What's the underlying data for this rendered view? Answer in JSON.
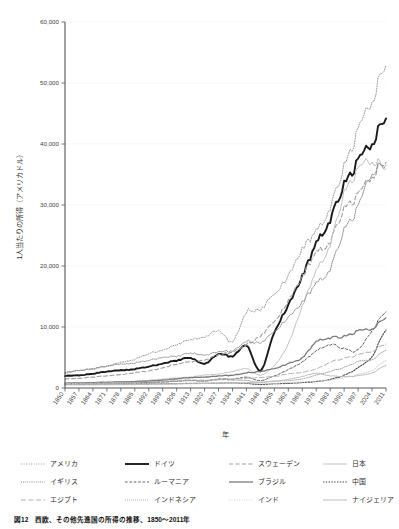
{
  "figure": {
    "caption": "図12　西欧、その他先進国の所得の推移、1850～2011年"
  },
  "chart_data": {
    "type": "line",
    "title": "",
    "xlabel": "年",
    "ylabel": "1人当たりの所得（アメリカドル）",
    "xlim": [
      1850,
      2011
    ],
    "ylim": [
      0,
      60000
    ],
    "ytick_labels": [
      "0",
      "10,000",
      "20,000",
      "30,000",
      "40,000",
      "50,000",
      "60,000"
    ],
    "ytick_values": [
      0,
      10000,
      20000,
      30000,
      40000,
      50000,
      60000
    ],
    "xtick_labels": [
      "1850",
      "1857",
      "1864",
      "1871",
      "1878",
      "1885",
      "1892",
      "1899",
      "1906",
      "1913",
      "1920",
      "1927",
      "1934",
      "1941",
      "1948",
      "1955",
      "1962",
      "1969",
      "1976",
      "1983",
      "1990",
      "1997",
      "2004",
      "2011"
    ],
    "xtick_values": [
      1850,
      1857,
      1864,
      1871,
      1878,
      1885,
      1892,
      1899,
      1906,
      1913,
      1920,
      1927,
      1934,
      1941,
      1948,
      1955,
      1962,
      1969,
      1976,
      1983,
      1990,
      1997,
      2004,
      2011
    ],
    "grid": true,
    "grid_axis": "y",
    "legend_position": "below",
    "legend_columns": 4,
    "x": [
      1850,
      1857,
      1864,
      1871,
      1878,
      1885,
      1892,
      1899,
      1906,
      1913,
      1920,
      1927,
      1934,
      1941,
      1948,
      1955,
      1962,
      1969,
      1976,
      1983,
      1990,
      1997,
      2004,
      2011
    ],
    "series": [
      {
        "name": "アメリカ",
        "style": "dotted",
        "color": "#9a9a9a",
        "width": 1.0,
        "values": [
          2400,
          2900,
          3100,
          3600,
          4200,
          4700,
          5600,
          6200,
          7100,
          7900,
          8200,
          9500,
          7600,
          12500,
          12800,
          15500,
          18300,
          23000,
          25500,
          29500,
          36500,
          42000,
          47500,
          52900
        ]
      },
      {
        "name": "ドイツ",
        "style": "solid",
        "color": "#1a1a1a",
        "width": 1.9,
        "values": [
          2000,
          2100,
          2350,
          2700,
          2900,
          3100,
          3500,
          4000,
          4500,
          4900,
          3900,
          5600,
          5200,
          7000,
          2800,
          9200,
          13500,
          18500,
          23500,
          27500,
          33500,
          37000,
          40500,
          44200
        ]
      },
      {
        "name": "スウェーデン",
        "style": "dashed",
        "color": "#a0a0a0",
        "width": 1.1,
        "values": [
          1500,
          1600,
          1800,
          2000,
          2200,
          2500,
          2800,
          3300,
          3900,
          4300,
          4500,
          5500,
          5900,
          7200,
          8500,
          11000,
          14200,
          18500,
          22000,
          24000,
          29500,
          31500,
          35000,
          37000
        ]
      },
      {
        "name": "日本",
        "style": "solid-light",
        "color": "#c2c2c2",
        "width": 1.0,
        "values": [
          800,
          820,
          860,
          900,
          1000,
          1100,
          1250,
          1450,
          1650,
          1800,
          2100,
          2300,
          2700,
          3200,
          2100,
          3700,
          7200,
          13500,
          19000,
          23500,
          32000,
          35500,
          37500,
          36000
        ]
      },
      {
        "name": "イギリス",
        "style": "dotted-dense",
        "color": "#8f8f8f",
        "width": 1.0,
        "values": [
          2600,
          2900,
          3200,
          3600,
          3900,
          4100,
          4500,
          5000,
          5200,
          5700,
          5300,
          6000,
          6100,
          7700,
          7400,
          9300,
          11500,
          14200,
          17000,
          19500,
          26000,
          29500,
          35500,
          36500
        ]
      },
      {
        "name": "ルーマニア",
        "style": "dash-short",
        "color": "#606060",
        "width": 1.0,
        "values": [
          600,
          620,
          660,
          700,
          760,
          820,
          900,
          980,
          1100,
          1250,
          1100,
          1500,
          1450,
          1800,
          1200,
          2000,
          3000,
          4300,
          6000,
          7100,
          6500,
          6200,
          9500,
          12500
        ]
      },
      {
        "name": "ブラジル",
        "style": "solid-mid",
        "color": "#7a7a7a",
        "width": 1.3,
        "values": [
          800,
          850,
          900,
          950,
          1000,
          1050,
          1150,
          1300,
          1500,
          1700,
          1750,
          2000,
          2100,
          2500,
          2700,
          3200,
          4000,
          5000,
          7500,
          8200,
          8500,
          9300,
          9800,
          11500
        ]
      },
      {
        "name": "中国",
        "style": "dotted-bold",
        "color": "#444444",
        "width": 1.1,
        "values": [
          700,
          690,
          670,
          660,
          650,
          660,
          680,
          700,
          720,
          750,
          760,
          800,
          820,
          760,
          560,
          700,
          750,
          900,
          1050,
          1400,
          2100,
          3300,
          5200,
          9500
        ]
      },
      {
        "name": "エジプト",
        "style": "dash-long",
        "color": "#b0b0b0",
        "width": 1.0,
        "values": [
          750,
          760,
          800,
          850,
          900,
          950,
          1000,
          1100,
          1200,
          1300,
          1250,
          1400,
          1450,
          1600,
          1700,
          1900,
          2300,
          2600,
          3100,
          4200,
          4900,
          5400,
          6100,
          7200
        ]
      },
      {
        "name": "インドネシア",
        "style": "dotted-fine",
        "color": "#9c9c9c",
        "width": 0.9,
        "values": [
          650,
          670,
          700,
          730,
          780,
          830,
          900,
          980,
          1100,
          1200,
          1150,
          1350,
          1300,
          1250,
          900,
          1150,
          1200,
          1500,
          2100,
          2700,
          3400,
          4300,
          4700,
          6200
        ]
      },
      {
        "name": "インド",
        "style": "dotted-pale",
        "color": "#c8c8c8",
        "width": 0.9,
        "values": [
          700,
          690,
          700,
          690,
          700,
          710,
          720,
          730,
          740,
          760,
          730,
          780,
          790,
          800,
          700,
          780,
          900,
          980,
          1100,
          1300,
          1700,
          2200,
          2900,
          4500
        ]
      },
      {
        "name": "ナイジェリア",
        "style": "solid-pale",
        "color": "#bdbdbd",
        "width": 1.0,
        "values": [
          500,
          510,
          520,
          530,
          550,
          570,
          600,
          630,
          660,
          700,
          720,
          800,
          850,
          900,
          950,
          1100,
          1400,
          1900,
          2400,
          2000,
          1900,
          2000,
          2500,
          3700
        ]
      }
    ]
  }
}
